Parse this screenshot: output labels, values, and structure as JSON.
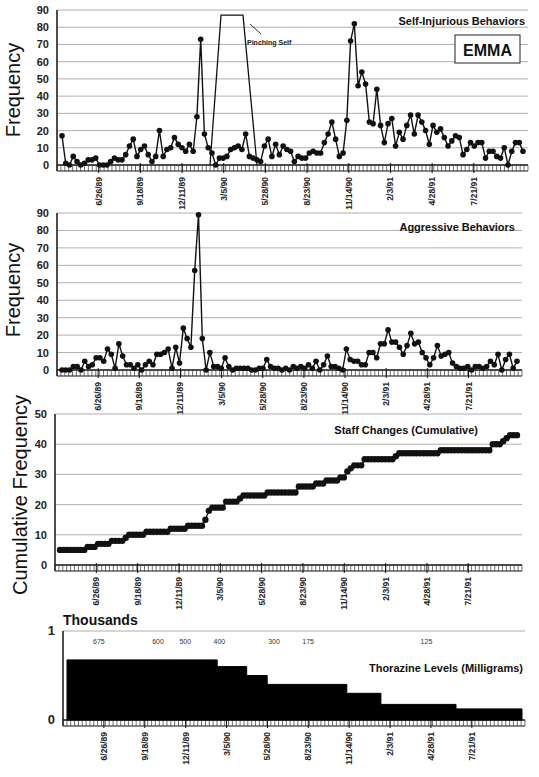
{
  "figure": {
    "subject_label": "EMMA",
    "caption_fragment": "...",
    "date_ticks": [
      "6/26/89",
      "9/18/89",
      "12/11/89",
      "3/5/90",
      "5/28/90",
      "8/23/90",
      "11/14/90",
      "2/3/91",
      "4/28/91",
      "7/21/91"
    ]
  },
  "chart_data": [
    {
      "type": "line",
      "title": "Self-Injurious Behaviors",
      "ylabel": "Frequency",
      "xlabel": "",
      "ylim": [
        0,
        90
      ],
      "yticks": [
        0,
        10,
        20,
        30,
        40,
        50,
        60,
        70,
        80,
        90
      ],
      "grid": true,
      "annotation": {
        "text": "Pinching Self",
        "note": "off-scale plateau above 90 between ~1/90 and ~4/90"
      },
      "legend_box": "EMMA",
      "x_tick_labels": [
        "6/26/89",
        "9/18/89",
        "12/11/89",
        "3/5/90",
        "5/28/90",
        "8/23/90",
        "11/14/90",
        "2/3/91",
        "4/28/91",
        "7/21/91"
      ],
      "values": [
        17,
        1,
        0,
        5,
        2,
        0,
        1,
        3,
        3,
        4,
        0,
        0,
        0,
        2,
        4,
        3,
        3,
        6,
        11,
        15,
        5,
        9,
        11,
        6,
        2,
        5,
        20,
        5,
        9,
        10,
        16,
        12,
        10,
        8,
        12,
        8,
        28,
        73,
        18,
        10,
        7,
        0,
        4,
        4,
        5,
        9,
        10,
        11,
        9,
        18,
        5,
        4,
        3,
        2,
        11,
        15,
        5,
        12,
        6,
        11,
        9,
        8,
        2,
        5,
        4,
        4,
        7,
        8,
        7,
        7,
        13,
        18,
        25,
        15,
        5,
        7,
        26,
        72,
        82,
        46,
        54,
        47,
        25,
        24,
        44,
        23,
        13,
        24,
        27,
        11,
        19,
        15,
        23,
        29,
        18,
        29,
        25,
        20,
        12,
        23,
        19,
        21,
        16,
        11,
        14,
        17,
        16,
        6,
        9,
        13,
        11,
        13,
        13,
        4,
        8,
        8,
        5,
        4,
        10,
        0,
        8,
        13,
        13,
        8
      ]
    },
    {
      "type": "line",
      "title": "Aggressive Behaviors",
      "ylabel": "Frequency",
      "xlabel": "",
      "ylim": [
        0,
        90
      ],
      "yticks": [
        0,
        10,
        20,
        30,
        40,
        50,
        60,
        70,
        80,
        90
      ],
      "grid": true,
      "x_tick_labels": [
        "6/26/89",
        "9/18/89",
        "12/11/89",
        "3/5/90",
        "5/28/90",
        "8/23/90",
        "11/14/90",
        "2/3/91",
        "4/28/91",
        "7/21/91"
      ],
      "values": [
        0,
        0,
        0,
        2,
        2,
        0,
        5,
        2,
        3,
        7,
        7,
        5,
        12,
        9,
        1,
        15,
        8,
        3,
        3,
        1,
        3,
        0,
        3,
        5,
        3,
        9,
        9,
        10,
        12,
        1,
        13,
        4,
        24,
        18,
        13,
        57,
        89,
        18,
        0,
        10,
        2,
        2,
        1,
        7,
        2,
        0,
        1,
        1,
        1,
        1,
        0,
        0,
        1,
        1,
        6,
        2,
        1,
        1,
        0,
        1,
        0,
        2,
        1,
        2,
        1,
        3,
        1,
        5,
        0,
        3,
        8,
        2,
        2,
        1,
        0,
        12,
        6,
        5,
        5,
        3,
        3,
        10,
        10,
        7,
        15,
        15,
        23,
        16,
        16,
        13,
        9,
        14,
        21,
        15,
        16,
        10,
        7,
        3,
        7,
        14,
        8,
        9,
        10,
        4,
        2,
        1,
        1,
        2,
        0,
        2,
        2,
        1,
        2,
        5,
        3,
        9,
        0,
        6,
        9,
        1,
        5
      ]
    },
    {
      "type": "line",
      "title": "Staff Changes (Cumulative)",
      "ylabel": "Cumulative Frequency",
      "xlabel": "",
      "ylim": [
        0,
        50
      ],
      "yticks": [
        0,
        10,
        20,
        30,
        40,
        50
      ],
      "grid": true,
      "x_tick_labels": [
        "6/26/89",
        "9/18/89",
        "12/11/89",
        "3/5/90",
        "5/28/90",
        "8/23/90",
        "11/14/90",
        "2/3/91",
        "4/28/91",
        "7/21/91"
      ],
      "values": [
        5,
        5,
        5,
        5,
        5,
        5,
        5,
        5,
        6,
        6,
        6,
        7,
        7,
        7,
        7,
        8,
        8,
        8,
        8,
        9,
        10,
        10,
        10,
        10,
        10,
        11,
        11,
        11,
        11,
        11,
        11,
        11,
        12,
        12,
        12,
        12,
        12,
        13,
        13,
        13,
        13,
        13,
        15,
        18,
        19,
        19,
        19,
        19,
        21,
        21,
        21,
        21,
        22,
        23,
        23,
        23,
        23,
        23,
        23,
        23,
        24,
        24,
        24,
        24,
        24,
        24,
        24,
        24,
        24,
        26,
        26,
        26,
        26,
        26,
        27,
        27,
        27,
        28,
        28,
        28,
        28,
        29,
        29,
        31,
        32,
        33,
        33,
        33,
        35,
        35,
        35,
        35,
        35,
        35,
        35,
        35,
        35,
        36,
        37,
        37,
        37,
        37,
        37,
        37,
        37,
        37,
        37,
        37,
        37,
        37,
        38,
        38,
        38,
        38,
        38,
        38,
        38,
        38,
        38,
        38,
        38,
        38,
        38,
        38,
        38,
        40,
        40,
        40,
        41,
        42,
        43,
        43,
        43
      ]
    },
    {
      "type": "area",
      "title": "Thorazine Levels (Milligrams)",
      "ylabel": "Thousands",
      "xlabel": "",
      "ylim": [
        0,
        1
      ],
      "yticks": [
        0,
        1
      ],
      "grid": false,
      "x_tick_labels": [
        "6/26/89",
        "9/18/89",
        "12/11/89",
        "3/5/90",
        "5/28/90",
        "8/23/90",
        "11/14/90",
        "2/3/91",
        "4/28/91",
        "7/21/91"
      ],
      "step_labels": [
        "675",
        "600",
        "500",
        "400",
        "300",
        "175",
        "125"
      ],
      "steps": [
        {
          "label": "675",
          "value": 0.675,
          "start_frac": 0.0,
          "end_frac": 0.33
        },
        {
          "label": "600",
          "value": 0.6,
          "start_frac": 0.33,
          "end_frac": 0.395
        },
        {
          "label": "500",
          "value": 0.5,
          "start_frac": 0.395,
          "end_frac": 0.44
        },
        {
          "label": "400",
          "value": 0.4,
          "start_frac": 0.44,
          "end_frac": 0.615
        },
        {
          "label": "300",
          "value": 0.3,
          "start_frac": 0.615,
          "end_frac": 0.69
        },
        {
          "label": "175",
          "value": 0.175,
          "start_frac": 0.69,
          "end_frac": 0.855
        },
        {
          "label": "125",
          "value": 0.125,
          "start_frac": 0.855,
          "end_frac": 1.0
        }
      ]
    }
  ]
}
